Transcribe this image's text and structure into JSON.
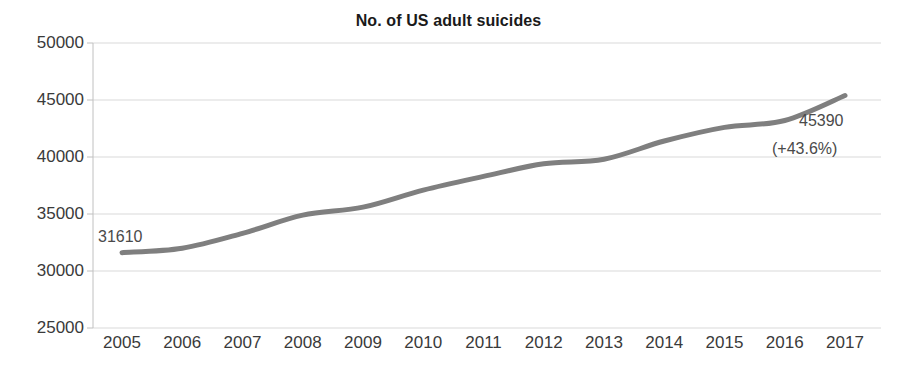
{
  "chart_data": {
    "type": "line",
    "title": "No. of US adult suicides",
    "xlabel": "",
    "ylabel": "",
    "categories": [
      "2005",
      "2006",
      "2007",
      "2008",
      "2009",
      "2010",
      "2011",
      "2012",
      "2013",
      "2014",
      "2015",
      "2016",
      "2017"
    ],
    "x": [
      2005,
      2006,
      2007,
      2008,
      2009,
      2010,
      2011,
      2012,
      2013,
      2014,
      2015,
      2016,
      2017
    ],
    "values": [
      31610,
      32000,
      33300,
      34900,
      35600,
      37100,
      38300,
      39400,
      39800,
      41400,
      42600,
      43200,
      45390
    ],
    "series": [
      {
        "name": "No. of US adult suicides",
        "values": [
          31610,
          32000,
          33300,
          34900,
          35600,
          37100,
          38300,
          39400,
          39800,
          41400,
          42600,
          43200,
          45390
        ]
      }
    ],
    "ylim": [
      25000,
      50000
    ],
    "yticks": [
      25000,
      30000,
      35000,
      40000,
      45000,
      50000
    ],
    "ytick_labels": [
      "25000",
      "30000",
      "35000",
      "40000",
      "45000",
      "50000"
    ],
    "xtick_labels": [
      "2005",
      "2006",
      "2007",
      "2008",
      "2009",
      "2010",
      "2011",
      "2012",
      "2013",
      "2014",
      "2015",
      "2016",
      "2017"
    ],
    "grid": true,
    "grid_axis": "y",
    "legend": false,
    "legend_position": "none",
    "line_color": "#7f7f7f",
    "line_width": 5,
    "grid_color": "#d9d9d9",
    "axis_color": "#c0c0c0",
    "text_color": "#3a3a3a",
    "annotations": [
      {
        "name": "first-value-label",
        "text": "31610",
        "x": 2005,
        "y": 31610
      },
      {
        "name": "last-value-label",
        "text": "45390",
        "x": 2017,
        "y": 45390
      },
      {
        "name": "percent-change-label",
        "text": "(+43.6%)",
        "x": 2017,
        "y": 45390
      }
    ]
  },
  "labels": {
    "first_value": "31610",
    "last_value": "45390",
    "percent_change": "(+43.6%)"
  }
}
